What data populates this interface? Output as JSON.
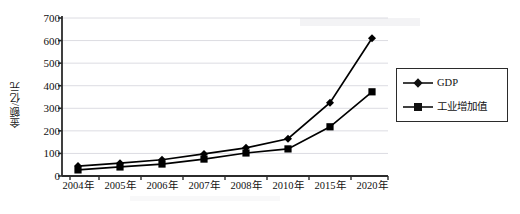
{
  "chart_data": {
    "type": "line",
    "title": "",
    "xlabel": "",
    "ylabel": "金额/亿元",
    "categories": [
      "2004年",
      "2005年",
      "2006年",
      "2007年",
      "2008年",
      "2010年",
      "2015年",
      "2020年"
    ],
    "ylim": [
      0,
      700
    ],
    "yticks": [
      0,
      100,
      200,
      300,
      400,
      500,
      600,
      700
    ],
    "ytick_labels": [
      "0",
      "100",
      "200",
      "300",
      "400",
      "500",
      "600",
      "700"
    ],
    "grid": true,
    "grid_axis": "y",
    "legend_position": "right",
    "series": [
      {
        "name": "GDP",
        "marker": "diamond",
        "color": "#000000",
        "values": [
          44,
          57,
          72,
          98,
          125,
          165,
          325,
          610
        ]
      },
      {
        "name": "工业增加值",
        "marker": "square",
        "color": "#000000",
        "values": [
          27,
          40,
          53,
          75,
          102,
          120,
          218,
          373
        ]
      }
    ]
  },
  "legend": {
    "items": [
      {
        "label": "GDP",
        "marker": "diamond"
      },
      {
        "label": "工业增加值",
        "marker": "square"
      }
    ]
  },
  "axes": {
    "y_title": "金额/亿元"
  },
  "colors": {
    "axis": "#2b2b2b",
    "grid": "#dcdce2",
    "series": "#111111",
    "background": "#ffffff"
  }
}
